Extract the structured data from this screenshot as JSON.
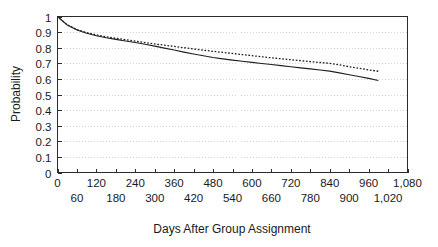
{
  "chart_data": {
    "type": "line",
    "title": "",
    "xlabel": "Days After Group Assignment",
    "ylabel": "Probability",
    "xlim": [
      0,
      1080
    ],
    "ylim": [
      0,
      1
    ],
    "grid": true,
    "legend": "none",
    "x_tick_labels_top": [
      "0",
      "120",
      "240",
      "360",
      "480",
      "600",
      "720",
      "840",
      "960",
      "1,080"
    ],
    "x_tick_values_top": [
      0,
      120,
      240,
      360,
      480,
      600,
      720,
      840,
      960,
      1080
    ],
    "x_tick_labels_bottom": [
      "60",
      "180",
      "300",
      "420",
      "540",
      "660",
      "780",
      "900",
      "1,020"
    ],
    "x_tick_values_bottom": [
      60,
      180,
      300,
      420,
      540,
      660,
      780,
      900,
      1020
    ],
    "x_tick_interval": 60,
    "y_tick_labels": [
      "1",
      "0.9",
      "0.8",
      "0.7",
      "0.6",
      "0.5",
      "0.4",
      "0.3",
      "0.2",
      "0.1",
      "0"
    ],
    "y_tick_values": [
      1,
      0.9,
      0.8,
      0.7,
      0.6,
      0.5,
      0.4,
      0.3,
      0.2,
      0.1,
      0
    ],
    "x": [
      0,
      30,
      60,
      90,
      120,
      150,
      180,
      210,
      240,
      270,
      300,
      330,
      360,
      390,
      420,
      450,
      480,
      510,
      540,
      570,
      600,
      630,
      660,
      690,
      720,
      750,
      780,
      810,
      840,
      870,
      900,
      930,
      960,
      990
    ],
    "series": [
      {
        "name": "solid-curve",
        "style": "solid",
        "color": "#202020",
        "values": [
          1.0,
          0.945,
          0.913,
          0.893,
          0.877,
          0.864,
          0.853,
          0.843,
          0.833,
          0.822,
          0.81,
          0.797,
          0.785,
          0.772,
          0.76,
          0.748,
          0.737,
          0.728,
          0.72,
          0.713,
          0.706,
          0.699,
          0.692,
          0.685,
          0.678,
          0.671,
          0.664,
          0.657,
          0.65,
          0.639,
          0.627,
          0.615,
          0.603,
          0.59
        ]
      },
      {
        "name": "dotted-curve",
        "style": "dotted",
        "color": "#202020",
        "values": [
          1.0,
          0.947,
          0.916,
          0.897,
          0.882,
          0.87,
          0.86,
          0.851,
          0.842,
          0.833,
          0.824,
          0.816,
          0.808,
          0.8,
          0.792,
          0.784,
          0.777,
          0.77,
          0.763,
          0.756,
          0.749,
          0.742,
          0.735,
          0.729,
          0.723,
          0.717,
          0.711,
          0.705,
          0.7,
          0.69,
          0.678,
          0.668,
          0.658,
          0.649
        ]
      }
    ]
  }
}
